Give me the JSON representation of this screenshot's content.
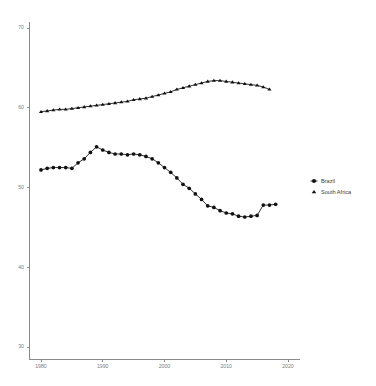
{
  "chart_data": {
    "type": "line",
    "title": "",
    "subtitle": "",
    "xlabel": "",
    "ylabel": "",
    "xlim": [
      1978,
      2022
    ],
    "ylim": [
      28.5,
      71.5
    ],
    "grid": false,
    "legend_position": "right",
    "xticks": [
      1980,
      1990,
      2000,
      2010,
      2020
    ],
    "xtick_labels": [
      "1980",
      "1990",
      "2000",
      "2010",
      "2020"
    ],
    "yticks": [
      30,
      40,
      50,
      60,
      70
    ],
    "ytick_labels": [
      "30",
      "40",
      "50",
      "60",
      "70"
    ],
    "x": [
      1980,
      1981,
      1982,
      1983,
      1984,
      1985,
      1986,
      1987,
      1988,
      1989,
      1990,
      1991,
      1992,
      1993,
      1994,
      1995,
      1996,
      1997,
      1998,
      1999,
      2000,
      2001,
      2002,
      2003,
      2004,
      2005,
      2006,
      2007,
      2008,
      2009,
      2010,
      2011,
      2012,
      2013,
      2014,
      2015,
      2016,
      2017,
      2018
    ],
    "series": [
      {
        "name": "Brazil",
        "marker": "circle",
        "color": "#111111",
        "values": [
          52.2,
          52.4,
          52.5,
          52.5,
          52.5,
          52.4,
          53.1,
          53.6,
          54.4,
          55.1,
          54.7,
          54.4,
          54.2,
          54.2,
          54.1,
          54.2,
          54.1,
          53.9,
          53.6,
          53.1,
          52.5,
          51.9,
          51.2,
          50.4,
          49.9,
          49.2,
          48.5,
          47.7,
          47.5,
          47.1,
          46.8,
          46.7,
          46.4,
          46.3,
          46.4,
          46.5,
          47.8,
          47.8,
          47.9
        ]
      },
      {
        "name": "South Africa",
        "marker": "triangle",
        "color": "#111111",
        "values": [
          59.5,
          59.6,
          59.7,
          59.8,
          59.8,
          59.9,
          60.0,
          60.1,
          60.2,
          60.3,
          60.4,
          60.5,
          60.6,
          60.7,
          60.8,
          61.0,
          61.1,
          61.2,
          61.4,
          61.6,
          61.8,
          62.0,
          62.3,
          62.5,
          62.7,
          62.9,
          63.1,
          63.3,
          63.4,
          63.4,
          63.3,
          63.2,
          63.1,
          63.0,
          62.9,
          62.8,
          62.6,
          62.3,
          null
        ]
      }
    ]
  },
  "legend": {
    "entries": [
      {
        "label": "Brazil",
        "marker": "circle-marker-icon"
      },
      {
        "label": "South Africa",
        "marker": "triangle-marker-icon"
      }
    ]
  }
}
